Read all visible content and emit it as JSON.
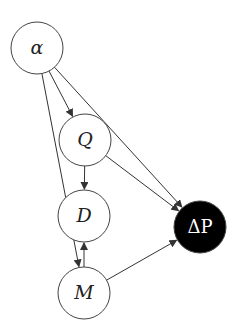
{
  "diagram": {
    "type": "directed-graph",
    "nodes": [
      {
        "id": "alpha",
        "label": "α",
        "x": 37,
        "y": 48,
        "r": 26,
        "fill": "#ffffff",
        "text": "#222222"
      },
      {
        "id": "Q",
        "label": "Q",
        "x": 85,
        "y": 140,
        "r": 26,
        "fill": "#ffffff",
        "text": "#222222"
      },
      {
        "id": "D",
        "label": "D",
        "x": 84,
        "y": 216,
        "r": 26,
        "fill": "#ffffff",
        "text": "#222222"
      },
      {
        "id": "M",
        "label": "M",
        "x": 84,
        "y": 293,
        "r": 26,
        "fill": "#ffffff",
        "text": "#222222"
      },
      {
        "id": "dP",
        "label": "ΔP",
        "x": 200,
        "y": 227,
        "r": 26,
        "fill": "#000000",
        "text": "#ffffff"
      }
    ],
    "edges": [
      {
        "from": "alpha",
        "to": "Q"
      },
      {
        "from": "alpha",
        "to": "M"
      },
      {
        "from": "alpha",
        "to": "dP"
      },
      {
        "from": "Q",
        "to": "D"
      },
      {
        "from": "Q",
        "to": "dP"
      },
      {
        "from": "M",
        "to": "D"
      },
      {
        "from": "M",
        "to": "dP"
      }
    ]
  }
}
